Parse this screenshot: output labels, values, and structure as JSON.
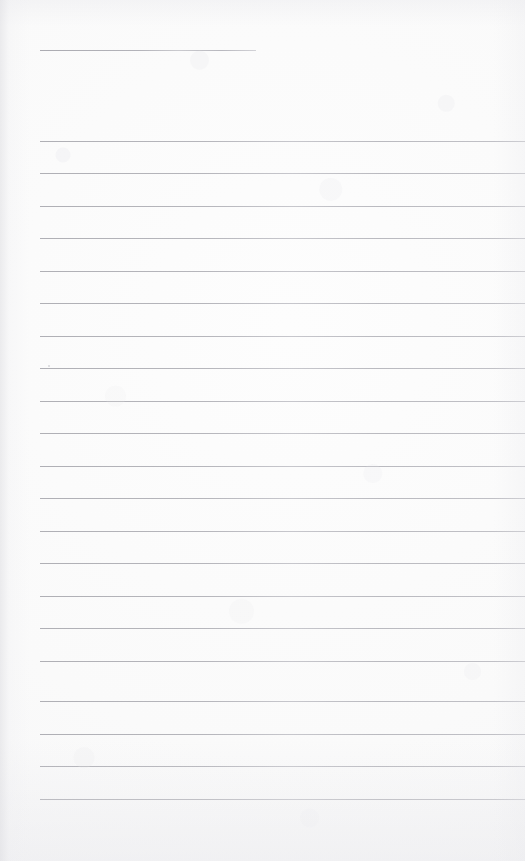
{
  "document": {
    "kind": "scanned-ruled-notepad-page",
    "title": "",
    "body_text": "",
    "page_width": 525,
    "page_height": 861,
    "paper_color": "#fafafa",
    "rule_color": "#b5b5ba",
    "rule_count": 22,
    "rule_spacing": 32.5,
    "left_margin": 40,
    "right_margin": 525
  },
  "rules": [
    {
      "label": "rule-1",
      "y": 50,
      "x_start": 40,
      "x_end": 256,
      "full_width": false
    },
    {
      "label": "rule-2",
      "y": 141,
      "x_start": 40,
      "x_end": 525,
      "full_width": true
    },
    {
      "label": "rule-3",
      "y": 173,
      "x_start": 40,
      "x_end": 525,
      "full_width": true
    },
    {
      "label": "rule-4",
      "y": 206,
      "x_start": 40,
      "x_end": 525,
      "full_width": true
    },
    {
      "label": "rule-5",
      "y": 238,
      "x_start": 40,
      "x_end": 525,
      "full_width": true
    },
    {
      "label": "rule-6",
      "y": 271,
      "x_start": 40,
      "x_end": 525,
      "full_width": true
    },
    {
      "label": "rule-7",
      "y": 303,
      "x_start": 40,
      "x_end": 525,
      "full_width": true
    },
    {
      "label": "rule-8",
      "y": 336,
      "x_start": 40,
      "x_end": 525,
      "full_width": true
    },
    {
      "label": "rule-9",
      "y": 368,
      "x_start": 40,
      "x_end": 525,
      "full_width": true
    },
    {
      "label": "rule-10",
      "y": 401,
      "x_start": 40,
      "x_end": 525,
      "full_width": true
    },
    {
      "label": "rule-11",
      "y": 433,
      "x_start": 40,
      "x_end": 525,
      "full_width": true
    },
    {
      "label": "rule-12",
      "y": 466,
      "x_start": 40,
      "x_end": 525,
      "full_width": true
    },
    {
      "label": "rule-13",
      "y": 498,
      "x_start": 40,
      "x_end": 525,
      "full_width": true
    },
    {
      "label": "rule-14",
      "y": 531,
      "x_start": 40,
      "x_end": 525,
      "full_width": true
    },
    {
      "label": "rule-15",
      "y": 563,
      "x_start": 40,
      "x_end": 525,
      "full_width": true
    },
    {
      "label": "rule-16",
      "y": 596,
      "x_start": 40,
      "x_end": 525,
      "full_width": true
    },
    {
      "label": "rule-17",
      "y": 628,
      "x_start": 40,
      "x_end": 525,
      "full_width": true
    },
    {
      "label": "rule-18",
      "y": 661,
      "x_start": 40,
      "x_end": 525,
      "full_width": true
    },
    {
      "label": "rule-19",
      "y": 701,
      "x_start": 40,
      "x_end": 525,
      "full_width": true
    },
    {
      "label": "rule-20",
      "y": 734,
      "x_start": 40,
      "x_end": 525,
      "full_width": true
    },
    {
      "label": "rule-21",
      "y": 766,
      "x_start": 40,
      "x_end": 525,
      "full_width": true
    },
    {
      "label": "rule-22",
      "y": 799,
      "x_start": 40,
      "x_end": 525,
      "full_width": true
    }
  ],
  "marks": [
    {
      "label": "stray-speck",
      "x": 48,
      "y": 365,
      "size": 2
    }
  ]
}
